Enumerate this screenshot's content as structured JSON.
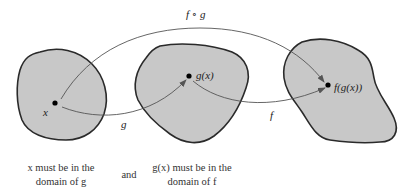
{
  "diagram": {
    "colors": {
      "region_fill": "#c8c8c8",
      "region_stroke": "#2a2a2a",
      "arrow": "#555555",
      "point": "#000000",
      "background": "#ffffff"
    },
    "regions": [
      {
        "id": "domain-g",
        "point_label": "x"
      },
      {
        "id": "range-g-domain-f",
        "point_label": "g(x)"
      },
      {
        "id": "range-f",
        "point_label": "f(g(x))"
      }
    ],
    "arrows": [
      {
        "from": "x",
        "to": "g(x)",
        "label": "g"
      },
      {
        "from": "g(x)",
        "to": "f(g(x))",
        "label": "f"
      },
      {
        "from": "x",
        "to": "f(g(x))",
        "label": "f ∘ g"
      }
    ],
    "captions": {
      "left_line1": "x must be in the",
      "left_line2": "domain of g",
      "middle": "and",
      "right_line1": "g(x) must be in the",
      "right_line2": "domain of f"
    }
  }
}
